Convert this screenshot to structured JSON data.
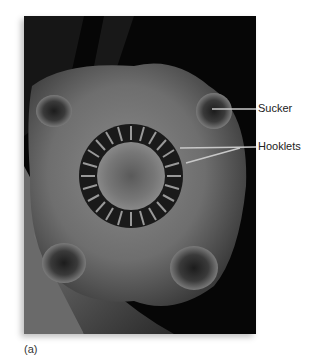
{
  "figure": {
    "labels": [
      {
        "id": "sucker",
        "text": "Sucker"
      },
      {
        "id": "hooklets",
        "text": "Hooklets"
      }
    ],
    "caption": "(a)"
  },
  "colors": {
    "background": "#ffffff",
    "photo_background": "#050505",
    "leader_line": "#bdbdbd",
    "label_text": "#222222"
  }
}
